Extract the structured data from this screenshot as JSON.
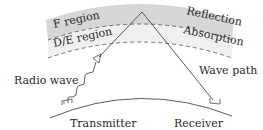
{
  "diagram": {
    "type": "ionospheric-radio-propagation",
    "layers": [
      {
        "name": "F region",
        "effect": "Reflection",
        "fill": "#d9d9d9"
      },
      {
        "name": "D/E region",
        "effect": "Absorption",
        "fill": "#f0f0f0"
      }
    ],
    "labels": {
      "f_region": "F region",
      "de_region": "D/E region",
      "reflection": "Reflection",
      "absorption": "Absorption",
      "radio_wave": "Radio wave",
      "wave_path": "Wave path",
      "transmitter": "Transmitter",
      "receiver": "Receiver"
    },
    "colors": {
      "line": "#4a4a4a",
      "f_band": "#d6d6d6",
      "de_band": "#efefef",
      "text": "#2a2a2a"
    }
  }
}
